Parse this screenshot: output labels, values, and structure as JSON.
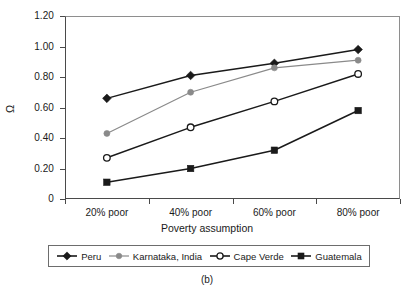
{
  "caption": "(b)",
  "cropped_title": "",
  "axes": {
    "y_label": "Ω",
    "x_label": "Poverty assumption",
    "y_ticks": [
      "1.20",
      "1.00",
      "0.80",
      "0.60",
      "0.40",
      "0.20",
      "0"
    ],
    "x_ticks": [
      "20% poor",
      "40% poor",
      "60% poor",
      "80% poor"
    ]
  },
  "legend": {
    "items": [
      {
        "label": "Peru",
        "marker": "filled-diamond",
        "color": "#1a1a1a"
      },
      {
        "label": "Karnataka, India",
        "marker": "filled-circle",
        "color": "#8a8a8a"
      },
      {
        "label": "Cape Verde",
        "marker": "open-circle",
        "color": "#1a1a1a"
      },
      {
        "label": "Guatemala",
        "marker": "filled-square",
        "color": "#1a1a1a"
      }
    ]
  },
  "chart_data": {
    "type": "line",
    "title": "",
    "xlabel": "Poverty assumption",
    "ylabel": "Ω",
    "categories": [
      "20% poor",
      "40% poor",
      "60% poor",
      "80% poor"
    ],
    "ylim": [
      0,
      1.2
    ],
    "ytick_values": [
      1.2,
      1.0,
      0.8,
      0.6,
      0.4,
      0.2,
      0
    ],
    "grid": false,
    "legend_position": "bottom",
    "series": [
      {
        "name": "Peru",
        "marker": "filled-diamond",
        "color": "#1a1a1a",
        "values": [
          0.66,
          0.81,
          0.89,
          0.98
        ]
      },
      {
        "name": "Karnataka, India",
        "marker": "filled-circle",
        "color": "#8a8a8a",
        "values": [
          0.43,
          0.7,
          0.86,
          0.91
        ]
      },
      {
        "name": "Cape Verde",
        "marker": "open-circle",
        "color": "#1a1a1a",
        "values": [
          0.27,
          0.47,
          0.64,
          0.82
        ]
      },
      {
        "name": "Guatemala",
        "marker": "filled-square",
        "color": "#1a1a1a",
        "values": [
          0.11,
          0.2,
          0.32,
          0.58
        ]
      }
    ]
  }
}
